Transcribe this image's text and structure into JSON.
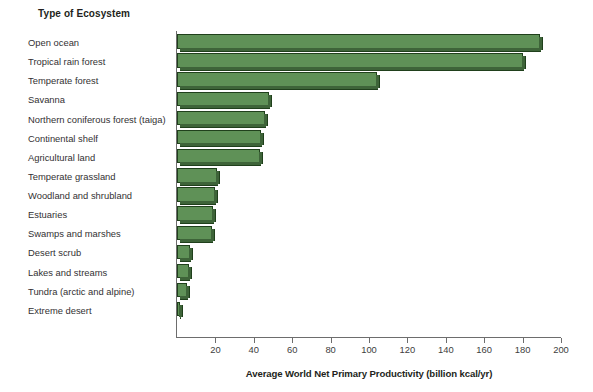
{
  "header": {
    "column_title": "Type of Ecosystem"
  },
  "axis": {
    "x_title": "Average World Net Primary Productivity (billion kcal/yr)",
    "x_ticks": [
      0,
      20,
      40,
      60,
      80,
      100,
      120,
      140,
      160,
      180,
      200
    ],
    "x_tick_labels": [
      "",
      "20",
      "40",
      "60",
      "80",
      "100",
      "120",
      "140",
      "160",
      "180",
      "200"
    ]
  },
  "colors": {
    "bar_face": "#5f9157",
    "bar_shade": "#3e6439",
    "bar_outline": "#20401c",
    "axis": "#6d6d6d",
    "text": "#231f20"
  },
  "chart_data": {
    "type": "bar",
    "orientation": "horizontal",
    "title": "Type of Ecosystem",
    "xlabel": "Average World Net Primary Productivity (billion kcal/yr)",
    "ylabel": "Type of Ecosystem",
    "xlim": [
      0,
      200
    ],
    "grid": false,
    "legend": false,
    "categories": [
      "Open ocean",
      "Tropical rain forest",
      "Temperate forest",
      "Savanna",
      "Northern coniferous forest (taiga)",
      "Continental shelf",
      "Agricultural land",
      "Temperate grassland",
      "Woodland and shrubland",
      "Estuaries",
      "Swamps and marshes",
      "Desert scrub",
      "Lakes and streams",
      "Tundra (arctic and alpine)",
      "Extreme desert"
    ],
    "values": [
      189,
      180,
      104,
      48,
      46,
      44,
      43,
      21,
      20,
      19,
      18,
      7,
      6,
      5,
      1.5
    ]
  }
}
